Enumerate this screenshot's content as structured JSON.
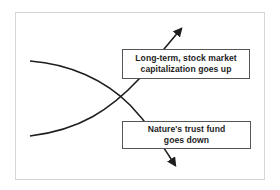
{
  "diagram": {
    "type": "crossing-trend-curves",
    "curves": [
      {
        "id": "stock-market",
        "direction": "up",
        "label_lines": [
          "Long-term, stock market",
          "capitalization goes up"
        ]
      },
      {
        "id": "nature-trust-fund",
        "direction": "down",
        "label_lines": [
          "Nature's trust fund",
          "goes down"
        ]
      }
    ],
    "colors": {
      "curve": "#1e1e1e",
      "box_border": "#555555",
      "frame_border": "#d6d6d6",
      "background": "#ffffff"
    }
  }
}
